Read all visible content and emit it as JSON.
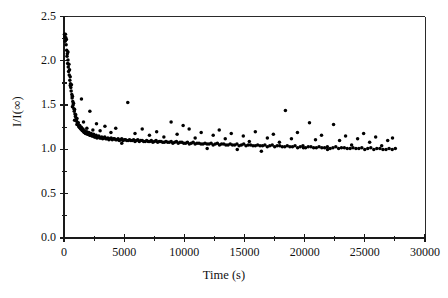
{
  "chart_data": {
    "type": "scatter",
    "title": "",
    "xlabel": "Time (s)",
    "ylabel": "I/I(∞)",
    "xlim": [
      0,
      30000
    ],
    "ylim": [
      0.0,
      2.5
    ],
    "xticks": [
      0,
      5000,
      10000,
      15000,
      20000,
      25000,
      30000
    ],
    "xticklabels": [
      "0",
      "5000",
      "10000",
      "15000",
      "20000",
      "25000",
      "30000"
    ],
    "xminor_step": 2500,
    "yticks": [
      0.0,
      0.5,
      1.0,
      1.5,
      2.0,
      2.5
    ],
    "yticklabels": [
      "0.0",
      "0.5",
      "1.0",
      "1.5",
      "2.0",
      "2.5"
    ],
    "yminor_step": 0.25,
    "grid": false,
    "legend": null,
    "marker": "filled-circle",
    "marker_color": "#000000",
    "marker_size_px": 2.4,
    "axis_color": "#1a1a1a",
    "background": "#ffffff",
    "series": [
      {
        "name": "I/I(inf) decay",
        "points": [
          [
            40,
            2.3
          ],
          [
            70,
            2.27
          ],
          [
            95,
            2.22
          ],
          [
            120,
            2.3
          ],
          [
            150,
            2.26
          ],
          [
            175,
            2.18
          ],
          [
            200,
            2.24
          ],
          [
            225,
            2.12
          ],
          [
            250,
            2.05
          ],
          [
            275,
            2.08
          ],
          [
            300,
            1.97
          ],
          [
            330,
            2.01
          ],
          [
            355,
            1.93
          ],
          [
            380,
            1.88
          ],
          [
            410,
            1.96
          ],
          [
            435,
            1.84
          ],
          [
            460,
            1.9
          ],
          [
            485,
            1.78
          ],
          [
            515,
            1.82
          ],
          [
            540,
            1.74
          ],
          [
            565,
            1.7
          ],
          [
            595,
            1.66
          ],
          [
            620,
            1.73
          ],
          [
            650,
            1.62
          ],
          [
            675,
            1.58
          ],
          [
            700,
            1.6
          ],
          [
            730,
            1.54
          ],
          [
            760,
            1.5
          ],
          [
            790,
            1.52
          ],
          [
            820,
            1.46
          ],
          [
            850,
            1.43
          ],
          [
            880,
            1.45
          ],
          [
            910,
            1.4
          ],
          [
            945,
            1.37
          ],
          [
            975,
            1.39
          ],
          [
            1010,
            1.34
          ],
          [
            1045,
            1.32
          ],
          [
            1080,
            1.35
          ],
          [
            1115,
            1.3
          ],
          [
            1150,
            1.28
          ],
          [
            1190,
            1.3
          ],
          [
            1230,
            1.26
          ],
          [
            1270,
            1.25
          ],
          [
            1310,
            1.27
          ],
          [
            1350,
            1.24
          ],
          [
            1395,
            1.23
          ],
          [
            1440,
            1.25
          ],
          [
            1485,
            1.22
          ],
          [
            1530,
            1.21
          ],
          [
            1580,
            1.23
          ],
          [
            1630,
            1.2
          ],
          [
            1680,
            1.19
          ],
          [
            1730,
            1.21
          ],
          [
            1785,
            1.18
          ],
          [
            1840,
            1.18
          ],
          [
            1895,
            1.2
          ],
          [
            1950,
            1.17
          ],
          [
            2010,
            1.17
          ],
          [
            2070,
            1.19
          ],
          [
            2130,
            1.16
          ],
          [
            2195,
            1.16
          ],
          [
            2260,
            1.18
          ],
          [
            2325,
            1.15
          ],
          [
            2390,
            1.15
          ],
          [
            2460,
            1.17
          ],
          [
            2530,
            1.14
          ],
          [
            2600,
            1.14
          ],
          [
            2670,
            1.16
          ],
          [
            2745,
            1.13
          ],
          [
            2820,
            1.14
          ],
          [
            2895,
            1.15
          ],
          [
            2975,
            1.13
          ],
          [
            3055,
            1.13
          ],
          [
            3135,
            1.14
          ],
          [
            3215,
            1.12
          ],
          [
            3300,
            1.13
          ],
          [
            3385,
            1.14
          ],
          [
            3470,
            1.12
          ],
          [
            3555,
            1.12
          ],
          [
            3645,
            1.13
          ],
          [
            3735,
            1.11
          ],
          [
            3825,
            1.12
          ],
          [
            3915,
            1.13
          ],
          [
            4010,
            1.11
          ],
          [
            4105,
            1.12
          ],
          [
            4200,
            1.12
          ],
          [
            4295,
            1.11
          ],
          [
            4395,
            1.11
          ],
          [
            4495,
            1.12
          ],
          [
            4595,
            1.1
          ],
          [
            4695,
            1.11
          ],
          [
            4800,
            1.12
          ],
          [
            4905,
            1.1
          ],
          [
            5010,
            1.11
          ],
          [
            5115,
            1.11
          ],
          [
            5225,
            1.1
          ],
          [
            5335,
            1.1
          ],
          [
            5445,
            1.11
          ],
          [
            5555,
            1.1
          ],
          [
            5670,
            1.1
          ],
          [
            5785,
            1.11
          ],
          [
            5900,
            1.09
          ],
          [
            6015,
            1.1
          ],
          [
            6135,
            1.11
          ],
          [
            6255,
            1.09
          ],
          [
            6375,
            1.1
          ],
          [
            6495,
            1.1
          ],
          [
            6620,
            1.09
          ],
          [
            6745,
            1.09
          ],
          [
            6870,
            1.1
          ],
          [
            6995,
            1.09
          ],
          [
            7125,
            1.09
          ],
          [
            7255,
            1.1
          ],
          [
            7385,
            1.08
          ],
          [
            7515,
            1.09
          ],
          [
            7650,
            1.1
          ],
          [
            7785,
            1.08
          ],
          [
            7920,
            1.09
          ],
          [
            8055,
            1.09
          ],
          [
            8195,
            1.08
          ],
          [
            8335,
            1.08
          ],
          [
            8475,
            1.09
          ],
          [
            8615,
            1.08
          ],
          [
            8760,
            1.08
          ],
          [
            8905,
            1.09
          ],
          [
            9050,
            1.07
          ],
          [
            9195,
            1.08
          ],
          [
            9345,
            1.09
          ],
          [
            9495,
            1.07
          ],
          [
            9645,
            1.08
          ],
          [
            9795,
            1.08
          ],
          [
            9950,
            1.07
          ],
          [
            10105,
            1.07
          ],
          [
            10260,
            1.08
          ],
          [
            10415,
            1.06
          ],
          [
            10575,
            1.07
          ],
          [
            10735,
            1.08
          ],
          [
            10895,
            1.06
          ],
          [
            11055,
            1.07
          ],
          [
            11220,
            1.07
          ],
          [
            11385,
            1.06
          ],
          [
            11550,
            1.06
          ],
          [
            11715,
            1.07
          ],
          [
            11885,
            1.06
          ],
          [
            12055,
            1.06
          ],
          [
            12225,
            1.07
          ],
          [
            12395,
            1.05
          ],
          [
            12570,
            1.06
          ],
          [
            12745,
            1.07
          ],
          [
            12920,
            1.05
          ],
          [
            13095,
            1.06
          ],
          [
            13275,
            1.06
          ],
          [
            13455,
            1.05
          ],
          [
            13635,
            1.05
          ],
          [
            13815,
            1.06
          ],
          [
            14000,
            1.05
          ],
          [
            14185,
            1.05
          ],
          [
            14370,
            1.06
          ],
          [
            14555,
            1.04
          ],
          [
            14745,
            1.05
          ],
          [
            14935,
            1.06
          ],
          [
            15125,
            1.04
          ],
          [
            15315,
            1.05
          ],
          [
            15510,
            1.05
          ],
          [
            15705,
            1.04
          ],
          [
            15900,
            1.04
          ],
          [
            16095,
            1.05
          ],
          [
            16295,
            1.04
          ],
          [
            16495,
            1.04
          ],
          [
            16695,
            1.05
          ],
          [
            16895,
            1.03
          ],
          [
            17100,
            1.04
          ],
          [
            17305,
            1.05
          ],
          [
            17510,
            1.03
          ],
          [
            17715,
            1.04
          ],
          [
            17925,
            1.04
          ],
          [
            18135,
            1.03
          ],
          [
            18345,
            1.03
          ],
          [
            18555,
            1.04
          ],
          [
            18770,
            1.03
          ],
          [
            18985,
            1.03
          ],
          [
            19200,
            1.04
          ],
          [
            19415,
            1.02
          ],
          [
            19635,
            1.03
          ],
          [
            19855,
            1.04
          ],
          [
            20075,
            1.02
          ],
          [
            20295,
            1.03
          ],
          [
            20520,
            1.03
          ],
          [
            20745,
            1.02
          ],
          [
            20970,
            1.02
          ],
          [
            21195,
            1.03
          ],
          [
            21425,
            1.02
          ],
          [
            21655,
            1.02
          ],
          [
            21885,
            1.03
          ],
          [
            22115,
            1.01
          ],
          [
            22350,
            1.02
          ],
          [
            22585,
            1.03
          ],
          [
            22820,
            1.01
          ],
          [
            23055,
            1.02
          ],
          [
            23295,
            1.02
          ],
          [
            23535,
            1.01
          ],
          [
            23775,
            1.01
          ],
          [
            24015,
            1.02
          ],
          [
            24260,
            1.01
          ],
          [
            24505,
            1.01
          ],
          [
            24750,
            1.02
          ],
          [
            24995,
            1.0
          ],
          [
            25245,
            1.01
          ],
          [
            25495,
            1.02
          ],
          [
            25745,
            1.0
          ],
          [
            25995,
            1.01
          ],
          [
            26250,
            1.01
          ],
          [
            26505,
            1.0
          ],
          [
            26760,
            1.0
          ],
          [
            27015,
            1.01
          ],
          [
            27275,
            1.0
          ],
          [
            27535,
            1.01
          ]
        ],
        "outliers": [
          [
            330,
            2.1
          ],
          [
            520,
            1.72
          ],
          [
            700,
            1.48
          ],
          [
            880,
            1.33
          ],
          [
            1070,
            1.28
          ],
          [
            1450,
            1.57
          ],
          [
            1620,
            1.31
          ],
          [
            1900,
            1.24
          ],
          [
            2150,
            1.43
          ],
          [
            2400,
            1.22
          ],
          [
            2700,
            1.29
          ],
          [
            3000,
            1.21
          ],
          [
            3400,
            1.26
          ],
          [
            3900,
            1.19
          ],
          [
            4300,
            1.24
          ],
          [
            4800,
            1.07
          ],
          [
            5300,
            1.53
          ],
          [
            5900,
            1.18
          ],
          [
            6500,
            1.23
          ],
          [
            7100,
            1.16
          ],
          [
            7700,
            1.2
          ],
          [
            8300,
            1.14
          ],
          [
            8900,
            1.31
          ],
          [
            9400,
            1.17
          ],
          [
            9900,
            1.27
          ],
          [
            10400,
            1.23
          ],
          [
            10900,
            1.13
          ],
          [
            11400,
            1.19
          ],
          [
            11900,
            1.01
          ],
          [
            12400,
            1.16
          ],
          [
            12900,
            1.22
          ],
          [
            13400,
            1.12
          ],
          [
            13900,
            1.18
          ],
          [
            14400,
            1.0
          ],
          [
            14900,
            1.15
          ],
          [
            15400,
            1.09
          ],
          [
            15900,
            1.2
          ],
          [
            16400,
            0.98
          ],
          [
            16900,
            1.13
          ],
          [
            17400,
            1.17
          ],
          [
            17900,
            1.08
          ],
          [
            18400,
            1.44
          ],
          [
            18900,
            1.12
          ],
          [
            19400,
            1.19
          ],
          [
            19900,
            1.02
          ],
          [
            20400,
            1.3
          ],
          [
            20900,
            1.11
          ],
          [
            21400,
            1.16
          ],
          [
            21900,
            1.0
          ],
          [
            22400,
            1.28
          ],
          [
            22900,
            1.1
          ],
          [
            23400,
            1.15
          ],
          [
            23900,
            1.05
          ],
          [
            24400,
            1.12
          ],
          [
            24900,
            1.18
          ],
          [
            25400,
            1.08
          ],
          [
            25900,
            1.14
          ],
          [
            26400,
            1.04
          ],
          [
            26900,
            1.1
          ],
          [
            27300,
            1.13
          ]
        ]
      }
    ]
  }
}
